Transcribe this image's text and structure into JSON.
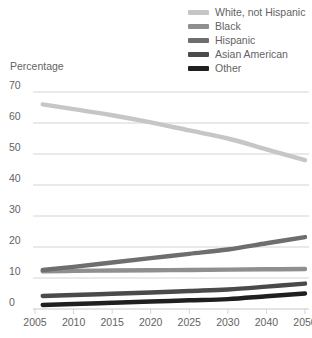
{
  "chart_data": {
    "type": "line",
    "title": "",
    "xlabel": "",
    "ylabel": "Percentage",
    "ylim": [
      0,
      70
    ],
    "ytick_values": [
      0,
      10,
      20,
      30,
      40,
      50,
      60,
      70
    ],
    "ytick_labels": [
      "0",
      "10",
      "20",
      "30",
      "40",
      "50",
      "60",
      "70"
    ],
    "xtick_labels": [
      "2005",
      "2010",
      "2015",
      "2020",
      "2025",
      "2030",
      "2040",
      "2050"
    ],
    "xtick_values": [
      2005,
      2010,
      2015,
      2020,
      2025,
      2030,
      2040,
      2050
    ],
    "grid": "horizontal",
    "legend_position": "top-right",
    "x": [
      2006,
      2010,
      2015,
      2020,
      2025,
      2030,
      2040,
      2050
    ],
    "series": [
      {
        "name": "White, not Hispanic",
        "color": "#c6c6c6",
        "values": [
          66,
          64.5,
          62.5,
          60.2,
          57.6,
          55.0,
          51.5,
          48.0
        ]
      },
      {
        "name": "Black",
        "color": "#8f8f8f",
        "values": [
          12.2,
          12.3,
          12.4,
          12.5,
          12.6,
          12.7,
          12.8,
          12.9
        ]
      },
      {
        "name": "Hispanic",
        "color": "#6e6e6e",
        "values": [
          12.6,
          13.6,
          15.0,
          16.4,
          17.8,
          19.2,
          21.2,
          23.2
        ]
      },
      {
        "name": "Asian American",
        "color": "#4a4a4a",
        "values": [
          4.2,
          4.5,
          4.9,
          5.3,
          5.8,
          6.3,
          7.2,
          8.2
        ]
      },
      {
        "name": "Other",
        "color": "#1f1f1f",
        "values": [
          1.3,
          1.6,
          2.0,
          2.4,
          2.8,
          3.2,
          4.1,
          5.0
        ]
      }
    ]
  },
  "legend": {
    "items": [
      {
        "label": "White, not Hispanic",
        "color": "#c6c6c6"
      },
      {
        "label": "Black",
        "color": "#8f8f8f"
      },
      {
        "label": "Hispanic",
        "color": "#6e6e6e"
      },
      {
        "label": "Asian American",
        "color": "#4a4a4a"
      },
      {
        "label": "Other",
        "color": "#1f1f1f"
      }
    ]
  },
  "axis": {
    "y_title": "Percentage",
    "grid_color": "#c9c9c9",
    "text_color": "#636363"
  }
}
